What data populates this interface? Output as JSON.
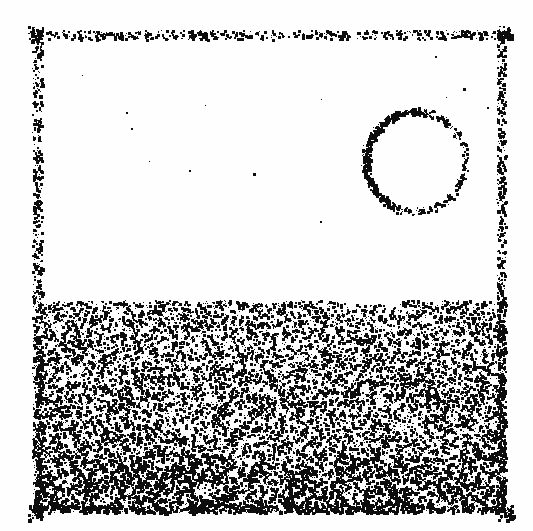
{
  "figure": {
    "domain": "Diagram",
    "kind": "particle-stipple-snapshot",
    "description": "Monochrome stippled snapshot of a two-dimensional particle simulation: a rectangular periodic box whose walls are drawn as bands of dots, a dense liquid phase filling the lower portion, an empty vapor phase above it, and a thin circular ring of particles (a bubble / droplet interface) suspended in the vapor region.",
    "canvas": {
      "width": 533,
      "height": 531
    },
    "background_color": "#fefefe",
    "particle_color": "#0d0d0d",
    "particle_size_px": [
      1,
      3
    ],
    "random_seed": 20240517
  },
  "box": {
    "label": "simulation-box",
    "x0": 35,
    "y0": 33,
    "x1": 505,
    "y1": 512,
    "wall_band_thickness": 9,
    "wall_dot_counts": {
      "top": 560,
      "bottom": 300,
      "left": 640,
      "right": 620
    },
    "wall_note": "walls rendered as scattered dot bands, slightly irregular, denser on the left and right verticals"
  },
  "phases": [
    {
      "name": "vapor",
      "label": "vapor-region",
      "y_from": 33,
      "y_to": 300,
      "dot_count": 14,
      "relative_density": 0.01,
      "note": "essentially empty white region above the liquid interface"
    },
    {
      "name": "liquid",
      "label": "liquid-region",
      "y_from": 300,
      "y_to": 512,
      "dot_count": 15500,
      "relative_density": 1.0,
      "density_gradient": "increases toward the bottom of the box",
      "density_top": 0.78,
      "density_bottom": 1.0,
      "note": "dense random stipple forming the condensed phase"
    }
  ],
  "interface": {
    "label": "liquid-vapor-interface",
    "mean_y": 300,
    "roughness_amplitude": 5,
    "sharpness": "sharp, slightly wavy"
  },
  "bubble": {
    "label": "bubble-ring",
    "center_x": 415,
    "center_y": 161,
    "radius": 50,
    "ring_thickness": 6,
    "dot_count": 900,
    "azimuthal_bias": "denser along the lower-left arc (approx. 200 deg)",
    "interior": "empty",
    "note": "thin dotted circle representing a vapour bubble or droplet boundary in the vapour region"
  }
}
